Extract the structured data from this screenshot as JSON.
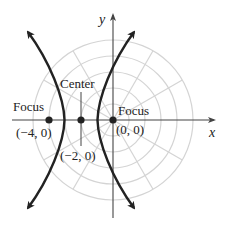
{
  "diagram": {
    "type": "hyperbola-on-polar-grid",
    "axes": {
      "x_label": "x",
      "y_label": "y"
    },
    "labels": {
      "focus_left": "Focus",
      "focus_left_coord": "(−4, 0)",
      "center": "Center",
      "center_coord": "(−2, 0)",
      "focus_right": "Focus",
      "focus_right_coord": "(0, 0)"
    },
    "points": [
      {
        "name": "focus-left",
        "x": -4,
        "y": 0
      },
      {
        "name": "center",
        "x": -2,
        "y": 0
      },
      {
        "name": "focus-right",
        "x": 0,
        "y": 0
      }
    ],
    "hyperbola": {
      "center": [
        -2,
        0
      ],
      "a": 1,
      "c": 2
    },
    "polar_grid": {
      "circles": 5,
      "rays_every_deg": 30
    },
    "colors": {
      "curve": "#222222",
      "grid": "#cfcfcf",
      "axis": "#444444"
    }
  }
}
